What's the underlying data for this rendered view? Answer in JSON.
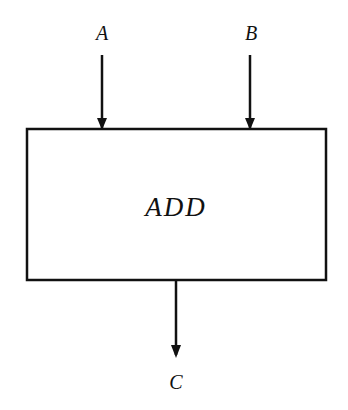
{
  "diagram": {
    "block": {
      "label": "ADD",
      "x": 27,
      "y": 128,
      "w": 299,
      "h": 152
    },
    "inputs": [
      {
        "label": "A",
        "x": 102,
        "y1": 55,
        "y2": 128
      },
      {
        "label": "B",
        "x": 250,
        "y1": 55,
        "y2": 128
      }
    ],
    "output": {
      "label": "C",
      "x": 176,
      "y1": 280,
      "y2": 357
    },
    "colors": {
      "stroke": "#111111",
      "background": "#ffffff"
    }
  }
}
